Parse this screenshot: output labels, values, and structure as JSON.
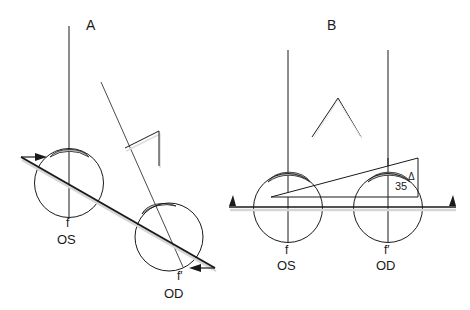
{
  "figure": {
    "panels": [
      {
        "id": "A",
        "label": "A",
        "left_eye": {
          "fovea_label": "f",
          "eye_label": "OS"
        },
        "right_eye": {
          "fovea_label": "f′",
          "eye_label": "OD"
        },
        "description": "Head tilted; OS visual axis vertical, OD visual axis deviated; prism shown"
      },
      {
        "id": "B",
        "label": "B",
        "left_eye": {
          "fovea_label": "f",
          "eye_label": "OS"
        },
        "right_eye": {
          "fovea_label": "f′",
          "eye_label": "OD"
        },
        "prism": {
          "power": "35",
          "unit": "Δ"
        }
      }
    ],
    "colors": {
      "stroke": "#1a1a1a",
      "cornea_fill": "#c8c8c8",
      "shadow": "#d6d6d6",
      "background": "#ffffff"
    }
  }
}
